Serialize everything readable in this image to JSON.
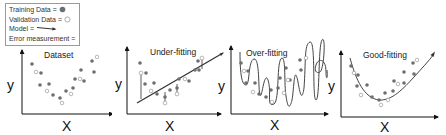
{
  "legend": {
    "training_label": "Training Data =",
    "validation_label": "Validation Data =",
    "model_label": "Model =",
    "error_label": "Error measurement ="
  },
  "colors": {
    "training_point": "#6e6e6e",
    "validation_point": "#ffffff",
    "validation_stroke": "#9a9a9a",
    "model_line": "#333333",
    "axis": "#111111"
  },
  "panels": [
    {
      "title": "Dataset",
      "xlabel": "X",
      "ylabel": "y"
    },
    {
      "title": "Under-fitting",
      "xlabel": "X",
      "ylabel": "y"
    },
    {
      "title": "Over-fitting",
      "xlabel": "X",
      "ylabel": "y"
    },
    {
      "title": "Good-fitting",
      "xlabel": "X",
      "ylabel": "y"
    }
  ]
}
